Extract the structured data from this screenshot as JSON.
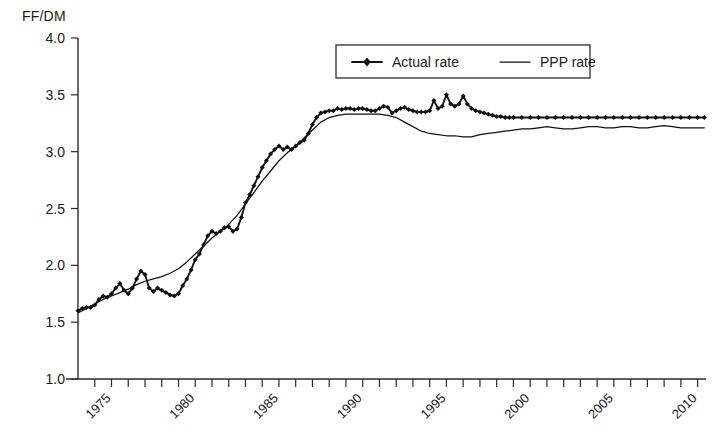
{
  "chart_data": {
    "type": "line",
    "title": "",
    "subtitle": "",
    "xlabel": "",
    "ylabel": "FF/DM",
    "ylim": [
      1.0,
      4.0
    ],
    "xlim": [
      1973.0,
      2010.5
    ],
    "ytick_labels": [
      "4.0",
      "3.5",
      "3.0",
      "2.5",
      "2.0",
      "1.5",
      "1.0"
    ],
    "ytick_values": [
      4.0,
      3.5,
      3.0,
      2.5,
      2.0,
      1.5,
      1.0
    ],
    "xtick_labels": [
      "1975",
      "1980",
      "1985",
      "1990",
      "1995",
      "2000",
      "2005",
      "2010"
    ],
    "xtick_values": [
      1975,
      1980,
      1985,
      1990,
      1995,
      2000,
      2005,
      2010
    ],
    "xtick_minor_step": 1,
    "xtick_label_rotation": -45,
    "grid": false,
    "legend_position": "top-center",
    "legend_entries": [
      {
        "label": "Actual rate",
        "marker": "diamond",
        "line": true
      },
      {
        "label": "PPP rate",
        "marker": "none",
        "line": true
      }
    ],
    "series": [
      {
        "name": "Actual rate",
        "marker": "diamond",
        "x": [
          1973.0,
          1973.25,
          1973.5,
          1973.75,
          1974.0,
          1974.25,
          1974.5,
          1974.75,
          1975.0,
          1975.25,
          1975.5,
          1975.75,
          1976.0,
          1976.25,
          1976.5,
          1976.75,
          1977.0,
          1977.25,
          1977.5,
          1977.75,
          1978.0,
          1978.25,
          1978.5,
          1978.75,
          1979.0,
          1979.25,
          1979.5,
          1979.75,
          1980.0,
          1980.25,
          1980.5,
          1980.75,
          1981.0,
          1981.25,
          1981.5,
          1981.75,
          1982.0,
          1982.25,
          1982.5,
          1982.75,
          1983.0,
          1983.25,
          1983.5,
          1983.75,
          1984.0,
          1984.25,
          1984.5,
          1984.75,
          1985.0,
          1985.25,
          1985.5,
          1985.75,
          1986.0,
          1986.25,
          1986.5,
          1986.75,
          1987.0,
          1987.25,
          1987.5,
          1987.75,
          1988.0,
          1988.25,
          1988.5,
          1988.75,
          1989.0,
          1989.25,
          1989.5,
          1989.75,
          1990.0,
          1990.25,
          1990.5,
          1990.75,
          1991.0,
          1991.25,
          1991.5,
          1991.75,
          1992.0,
          1992.25,
          1992.5,
          1992.75,
          1993.0,
          1993.25,
          1993.5,
          1993.75,
          1994.0,
          1994.25,
          1994.5,
          1994.75,
          1995.0,
          1995.25,
          1995.5,
          1995.75,
          1996.0,
          1996.25,
          1996.5,
          1996.75,
          1997.0,
          1997.25,
          1997.5,
          1997.75,
          1998.0,
          1998.25,
          1998.5,
          1998.75,
          1999.0,
          1999.5,
          2000.0,
          2000.5,
          2001.0,
          2001.5,
          2002.0,
          2002.5,
          2003.0,
          2003.5,
          2004.0,
          2004.5,
          2005.0,
          2005.5,
          2006.0,
          2006.5,
          2007.0,
          2007.5,
          2008.0,
          2008.5,
          2009.0,
          2009.5,
          2010.0,
          2010.4
        ],
        "y": [
          1.6,
          1.62,
          1.63,
          1.63,
          1.65,
          1.7,
          1.73,
          1.72,
          1.75,
          1.8,
          1.84,
          1.78,
          1.75,
          1.8,
          1.88,
          1.95,
          1.92,
          1.8,
          1.77,
          1.8,
          1.78,
          1.76,
          1.74,
          1.73,
          1.75,
          1.82,
          1.88,
          1.96,
          2.05,
          2.1,
          2.18,
          2.26,
          2.3,
          2.28,
          2.3,
          2.33,
          2.34,
          2.3,
          2.32,
          2.42,
          2.55,
          2.62,
          2.7,
          2.78,
          2.86,
          2.92,
          2.98,
          3.02,
          3.05,
          3.02,
          3.04,
          3.02,
          3.05,
          3.08,
          3.1,
          3.16,
          3.24,
          3.3,
          3.34,
          3.35,
          3.36,
          3.36,
          3.38,
          3.37,
          3.38,
          3.38,
          3.37,
          3.38,
          3.38,
          3.37,
          3.36,
          3.36,
          3.38,
          3.4,
          3.39,
          3.34,
          3.36,
          3.38,
          3.39,
          3.37,
          3.36,
          3.35,
          3.35,
          3.35,
          3.36,
          3.45,
          3.38,
          3.4,
          3.5,
          3.42,
          3.4,
          3.42,
          3.49,
          3.42,
          3.38,
          3.36,
          3.35,
          3.34,
          3.33,
          3.32,
          3.31,
          3.31,
          3.3,
          3.3,
          3.3,
          3.3,
          3.3,
          3.3,
          3.3,
          3.3,
          3.3,
          3.3,
          3.3,
          3.3,
          3.3,
          3.3,
          3.3,
          3.3,
          3.3,
          3.3,
          3.3,
          3.3,
          3.3,
          3.3,
          3.3,
          3.3,
          3.3,
          3.3
        ]
      },
      {
        "name": "PPP rate",
        "marker": "none",
        "x": [
          1973.0,
          1973.5,
          1974.0,
          1974.5,
          1975.0,
          1975.5,
          1976.0,
          1976.5,
          1977.0,
          1977.5,
          1978.0,
          1978.5,
          1979.0,
          1979.5,
          1980.0,
          1980.5,
          1981.0,
          1981.5,
          1982.0,
          1982.5,
          1983.0,
          1983.5,
          1984.0,
          1984.5,
          1985.0,
          1985.5,
          1986.0,
          1986.5,
          1987.0,
          1987.5,
          1988.0,
          1988.5,
          1989.0,
          1989.5,
          1990.0,
          1990.5,
          1991.0,
          1991.5,
          1992.0,
          1992.5,
          1993.0,
          1993.5,
          1994.0,
          1994.5,
          1995.0,
          1995.5,
          1996.0,
          1996.5,
          1997.0,
          1997.5,
          1998.0,
          1998.5,
          1999.0,
          1999.5,
          2000.0,
          2000.5,
          2001.0,
          2001.5,
          2002.0,
          2002.5,
          2003.0,
          2003.5,
          2004.0,
          2004.5,
          2005.0,
          2005.5,
          2006.0,
          2006.5,
          2007.0,
          2007.5,
          2008.0,
          2008.5,
          2009.0,
          2009.5,
          2010.0,
          2010.4
        ],
        "y": [
          1.58,
          1.62,
          1.66,
          1.7,
          1.73,
          1.76,
          1.79,
          1.83,
          1.86,
          1.88,
          1.9,
          1.93,
          1.97,
          2.03,
          2.1,
          2.17,
          2.24,
          2.3,
          2.36,
          2.44,
          2.54,
          2.64,
          2.74,
          2.83,
          2.92,
          2.99,
          3.05,
          3.12,
          3.19,
          3.26,
          3.3,
          3.32,
          3.33,
          3.33,
          3.33,
          3.33,
          3.33,
          3.32,
          3.3,
          3.26,
          3.22,
          3.18,
          3.16,
          3.15,
          3.14,
          3.14,
          3.13,
          3.13,
          3.15,
          3.16,
          3.17,
          3.18,
          3.19,
          3.2,
          3.2,
          3.21,
          3.22,
          3.21,
          3.2,
          3.2,
          3.21,
          3.22,
          3.22,
          3.21,
          3.21,
          3.22,
          3.22,
          3.21,
          3.21,
          3.22,
          3.23,
          3.22,
          3.21,
          3.21,
          3.21,
          3.21
        ]
      }
    ]
  },
  "axes": {
    "y_axis_title": "FF/DM"
  }
}
